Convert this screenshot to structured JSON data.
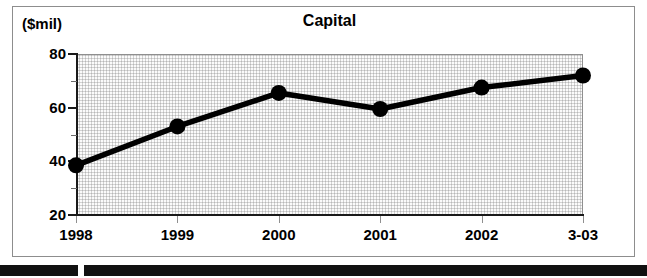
{
  "figure": {
    "unit_label": "($mil)",
    "title": "Capital"
  },
  "axes": {
    "y_tick_labels": [
      "80",
      "60",
      "40",
      "20"
    ],
    "y_minor_values": [
      70,
      50,
      30
    ],
    "x_tick_labels": [
      "1998",
      "1999",
      "2000",
      "2001",
      "2002",
      "3-03"
    ]
  },
  "colors": {
    "line": "#000000",
    "marker": "#000000",
    "plot_background": "#fbfbfb",
    "axis": "#1a1a1a",
    "frame": "#8d8d8d",
    "rule": "#111111"
  },
  "chart_data": {
    "type": "line",
    "title": "Capital",
    "subtitle": "",
    "xlabel": "",
    "ylabel": "($mil)",
    "categories": [
      "1998",
      "1999",
      "2000",
      "2001",
      "2002",
      "3-03"
    ],
    "values": [
      38.5,
      53,
      65.5,
      59.5,
      67.5,
      72
    ],
    "series": [
      {
        "name": "Capital",
        "values": [
          38.5,
          53,
          65.5,
          59.5,
          67.5,
          72
        ]
      }
    ],
    "ylim": [
      20,
      80
    ],
    "yticks": [
      20,
      40,
      60,
      80
    ],
    "yminorticks": [
      30,
      50,
      70
    ],
    "grid": false,
    "legend": "none",
    "markers": "filled-circle",
    "units": "$mil"
  }
}
